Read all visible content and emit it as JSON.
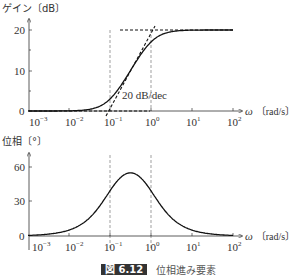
{
  "chart_data": [
    {
      "type": "line",
      "title": "Gain plot",
      "ylabel": "ゲイン〔dB〕",
      "xlabel": "ω〔rad/s〕",
      "xscale": "log",
      "xlim": [
        0.001,
        100
      ],
      "ylim": [
        0,
        20
      ],
      "yticks": [
        0,
        10,
        20
      ],
      "xticks": [
        "10^-3",
        "10^-2",
        "10^-1",
        "10^0",
        "10^1",
        "10^2"
      ],
      "annotation": "20 dB/dec",
      "reference_lines": {
        "vertical_dashed": [
          0.1,
          1
        ],
        "horizontal_dashed": [
          0,
          20
        ]
      },
      "series": [
        {
          "name": "exact gain",
          "style": "solid",
          "x": [
            0.001,
            0.01,
            0.03,
            0.1,
            0.2,
            0.316,
            0.5,
            1,
            2,
            10,
            100
          ],
          "y": [
            0.0,
            0.04,
            0.37,
            2.96,
            5.9,
            9.6,
            13.0,
            17.0,
            19.0,
            19.96,
            20.0
          ]
        },
        {
          "name": "asymptote",
          "style": "dashed",
          "x": [
            0.001,
            0.1,
            1,
            100
          ],
          "y": [
            0,
            0,
            20,
            20
          ]
        }
      ]
    },
    {
      "type": "line",
      "title": "Phase plot",
      "ylabel": "位相〔°〕",
      "xlabel": "ω〔rad/s〕",
      "xscale": "log",
      "xlim": [
        0.001,
        100
      ],
      "ylim": [
        0,
        60
      ],
      "yticks": [
        0,
        30,
        60
      ],
      "xticks": [
        "10^-3",
        "10^-2",
        "10^-1",
        "10^0",
        "10^1",
        "10^2"
      ],
      "reference_lines": {
        "vertical_dashed": [
          0.1,
          1
        ]
      },
      "series": [
        {
          "name": "phase",
          "style": "solid",
          "x": [
            0.001,
            0.01,
            0.03,
            0.1,
            0.2,
            0.316,
            0.5,
            1,
            3,
            10,
            100
          ],
          "y": [
            0.5,
            5.1,
            14.1,
            39.3,
            52.1,
            54.9,
            51.3,
            39.3,
            17.6,
            5.1,
            0.5
          ]
        }
      ]
    }
  ],
  "labels": {
    "gain_ylabel": "ゲイン〔dB〕",
    "phase_ylabel": "位相〔°〕",
    "xlabel_omega": "ω",
    "xlabel_unit": "〔rad/s〕",
    "slope_annotation": "20 dB/dec",
    "gain_ticks": [
      "20",
      "10",
      "0"
    ],
    "phase_ticks": [
      "60",
      "30",
      "0"
    ],
    "x_tick_base": "10",
    "x_tick_exps": [
      "−3",
      "−2",
      "−1",
      "0",
      "1",
      "2"
    ]
  },
  "caption": {
    "number": "図 6.12",
    "text": "位相進み要素"
  }
}
